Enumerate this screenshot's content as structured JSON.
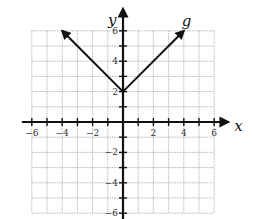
{
  "chart_data": {
    "type": "line",
    "title": "",
    "xlabel": "x",
    "ylabel": "y",
    "xlim": [
      -6,
      6
    ],
    "ylim": [
      -6,
      6
    ],
    "grid": true,
    "x_ticks": [
      -6,
      -4,
      -2,
      2,
      4,
      6
    ],
    "y_ticks": [
      6,
      4,
      2,
      -2,
      -4,
      -6
    ],
    "x_tick_labels": [
      "-6",
      "-4",
      "-2",
      "2",
      "4",
      "6"
    ],
    "y_tick_labels": [
      "6",
      "4",
      "2",
      "-2",
      "-4",
      "-6"
    ],
    "series": [
      {
        "name": "g",
        "label": "g",
        "equation": "g(x) = |x| + 2",
        "x": [
          -4,
          0,
          4
        ],
        "y": [
          6,
          2,
          6
        ],
        "arrows_at_ends": true
      }
    ]
  }
}
